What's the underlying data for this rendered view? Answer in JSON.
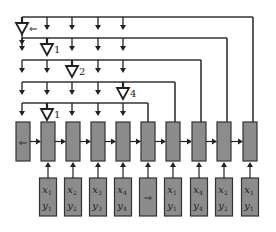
{
  "diagram": {
    "title": "",
    "colors": {
      "box_fill": "#8c8c8c",
      "stroke": "#333333",
      "background": "#ffffff"
    },
    "bus_rows": [
      {
        "y": 17,
        "x_end": 253,
        "tap_col": 0,
        "label": "⇐"
      },
      {
        "y": 38,
        "x_end": 227,
        "tap_col": 1,
        "label": "1"
      },
      {
        "y": 60,
        "x_end": 201,
        "tap_col": 2,
        "label": "2"
      },
      {
        "y": 82,
        "x_end": 175,
        "tap_col": 4,
        "label": "4"
      },
      {
        "y": 103,
        "x_end": 148,
        "tap_col": 1,
        "label": "1"
      }
    ],
    "column_x": [
      22,
      47,
      72,
      98,
      123
    ],
    "rnn_cells": [
      {
        "cx": 23,
        "label": "⇐"
      },
      {
        "cx": 48,
        "label": ""
      },
      {
        "cx": 73,
        "label": ""
      },
      {
        "cx": 98,
        "label": ""
      },
      {
        "cx": 123,
        "label": ""
      },
      {
        "cx": 148,
        "label": ""
      },
      {
        "cx": 173,
        "label": ""
      },
      {
        "cx": 199,
        "label": ""
      },
      {
        "cx": 224,
        "label": ""
      },
      {
        "cx": 250,
        "label": ""
      }
    ],
    "inputs": [
      {
        "cx": 48,
        "x": "x",
        "xs": "1",
        "y": "y",
        "ys": "1"
      },
      {
        "cx": 73,
        "x": "x",
        "xs": "2",
        "y": "y",
        "ys": "2"
      },
      {
        "cx": 98,
        "x": "x",
        "xs": "3",
        "y": "y",
        "ys": "3"
      },
      {
        "cx": 123,
        "x": "x",
        "xs": "4",
        "y": "y",
        "ys": "4"
      },
      {
        "cx": 148,
        "symbol": "⇒"
      },
      {
        "cx": 173,
        "x": "x",
        "xs": "1",
        "y": "y",
        "ys": "1"
      },
      {
        "cx": 199,
        "x": "x",
        "xs": "4",
        "y": "y",
        "ys": "4"
      },
      {
        "cx": 224,
        "x": "x",
        "xs": "2",
        "y": "y",
        "ys": "2"
      },
      {
        "cx": 250,
        "x": "x",
        "xs": "1",
        "y": "y",
        "ys": "1"
      }
    ]
  }
}
